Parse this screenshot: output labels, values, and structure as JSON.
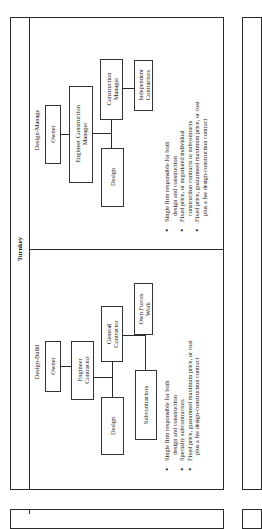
{
  "header": {
    "title": "Turnkey"
  },
  "panels": [
    {
      "id": "design-manage",
      "label": "Design-Manage",
      "boxes": {
        "owner": "Owner",
        "engineer_construction_manager_line1": "Engineer Construction",
        "engineer_construction_manager_line2": "Manager",
        "construction_manager_line1": "Construction",
        "construction_manager_line2": "Manager",
        "independent_contractors_line1": "Independent",
        "independent_contractors_line2": "Contractors",
        "design": "Design"
      },
      "bullets": [
        {
          "line1": "Single firm responsible for both",
          "line2": "design and construction"
        },
        {
          "line1": "Fixed price, or negotiated individual",
          "line2": "construction contracts or subcontracts"
        },
        {
          "line1": "Fixed price, guaranteed maximum price, or cost",
          "line2": "plus a fee design-construction contract"
        }
      ]
    },
    {
      "id": "design-build",
      "label": "Design-Build",
      "boxes": {
        "owner": "Owner",
        "engineer_contractor_line1": "Engineer",
        "engineer_contractor_line2": "Contractor",
        "general_contractor_line1": "General",
        "general_contractor_line2": "Contractor",
        "own_forces_work_line1": "Own Forces",
        "own_forces_work_line2": "Work",
        "subcontractors": "Subcontractors",
        "design": "Design"
      },
      "bullets": [
        {
          "line1": "Single firm responsible for both",
          "line2": "design and construction"
        },
        {
          "line1": "Specialty  subcontractors",
          "line2": ""
        },
        {
          "line1": "Fixed price, guaranteed maximum price, or cost",
          "line2": "plus a fee design-construction contract"
        }
      ]
    }
  ]
}
